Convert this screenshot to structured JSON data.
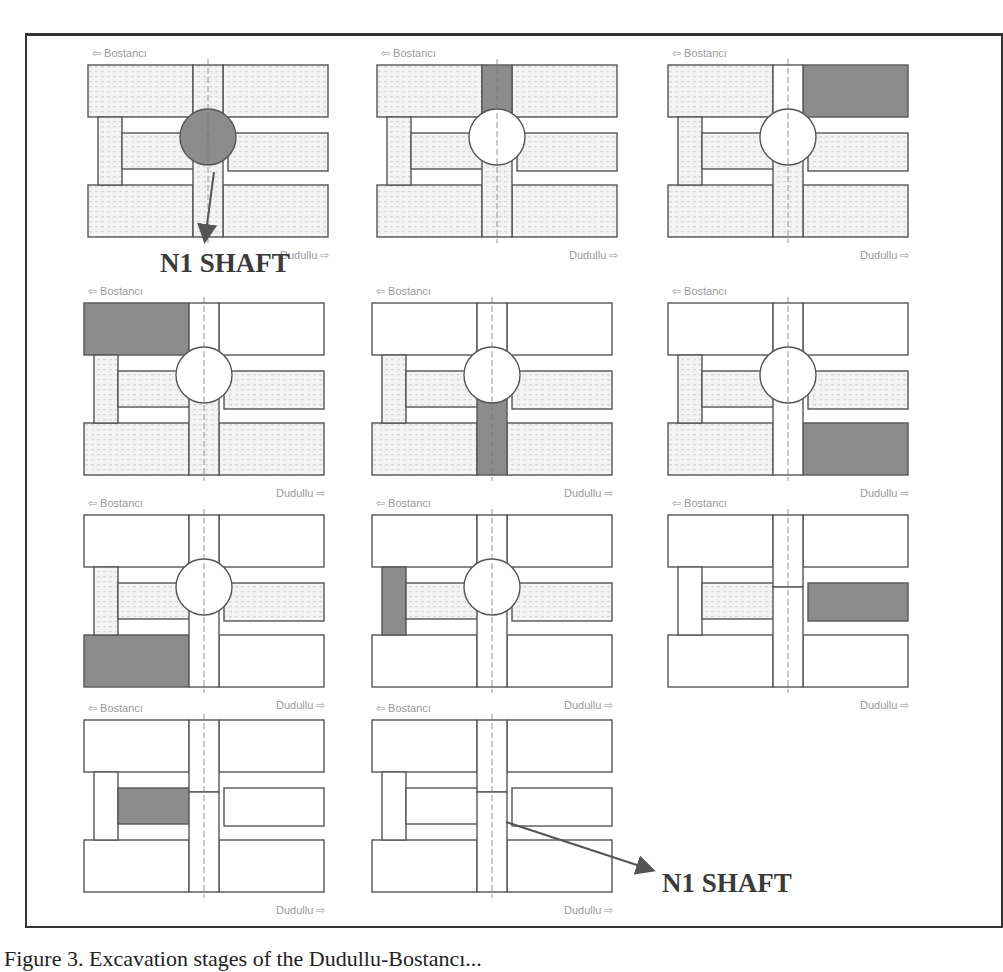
{
  "figure": {
    "caption": "Figure 3.   Excavation stages of the Dudullu-Bostancı...",
    "callouts": [
      {
        "text": "N1 SHAFT",
        "points_to": "shaft circle in stage 1"
      },
      {
        "text": "N1 SHAFT",
        "points_to": "shaft centerline in stage 11"
      }
    ]
  },
  "labels": {
    "top": "Bostancı",
    "bottom": "Dudullu"
  },
  "colors": {
    "excavating": "#8c8c8c",
    "outline": "#555555",
    "hatch": "#d8d8d8",
    "excavated": "#ffffff"
  },
  "stages": [
    {
      "id": 1,
      "active": "N1 shaft",
      "tag": "N1"
    },
    {
      "id": 2,
      "active": "upper shaft extension",
      "tag": "N1"
    },
    {
      "id": 3,
      "active": "upper-right gallery",
      "tag": "N1"
    },
    {
      "id": 4,
      "active": "upper-left gallery",
      "tag": "N1"
    },
    {
      "id": 5,
      "active": "lower shaft extension",
      "tag": "N1"
    },
    {
      "id": 6,
      "active": "lower-right gallery",
      "tag": "N1"
    },
    {
      "id": 7,
      "active": "lower-left gallery",
      "tag": "N1"
    },
    {
      "id": 8,
      "active": "left connecting pillar",
      "tag": "N1"
    },
    {
      "id": 9,
      "active": "middle-right tunnel",
      "tag": "N1"
    },
    {
      "id": 10,
      "active": "middle-left tunnel",
      "tag": "N1"
    },
    {
      "id": 11,
      "active": "completed",
      "tag": ""
    }
  ]
}
